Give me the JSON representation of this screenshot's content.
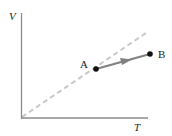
{
  "diagram": {
    "type": "V-T process diagram",
    "axes": {
      "y_label": "V",
      "x_label": "T"
    },
    "reference_line": {
      "style": "dashed",
      "color": "#c8c8c8",
      "description": "proportional line through origin"
    },
    "process": {
      "start_label": "A",
      "end_label": "B",
      "arrow_color": "#808080",
      "point_color": "#111111"
    }
  }
}
